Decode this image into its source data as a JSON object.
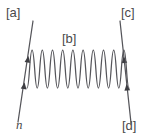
{
  "figure": {
    "kind": "feynman-diagram",
    "background_color": "#ffffff",
    "stroke_color": "#55555a",
    "label_color": "#4a4a4a",
    "width": 152,
    "height": 140
  },
  "labels": {
    "top_left": "[a]",
    "top_right": "[c]",
    "center_top": "[b]",
    "bottom_right": "[d]",
    "bottom_left": "n"
  },
  "elements": {
    "left_fermion_line": {
      "name": "left-fermion-line",
      "from": {
        "x": 18,
        "y": 122
      },
      "to": {
        "x": 33,
        "y": 21
      },
      "arrow_count": 2,
      "arrow_direction": "up"
    },
    "right_fermion_line": {
      "name": "right-fermion-line",
      "from": {
        "x": 131,
        "y": 123
      },
      "to": {
        "x": 120,
        "y": 21
      },
      "arrow_count": 2,
      "arrow_direction": "up"
    },
    "boson_propagator": {
      "name": "wavy-boson-propagator",
      "shape": "sine-wave",
      "x_start": 27,
      "x_end": 129,
      "center_y": 69,
      "amplitude": 19,
      "periods": 5
    }
  }
}
